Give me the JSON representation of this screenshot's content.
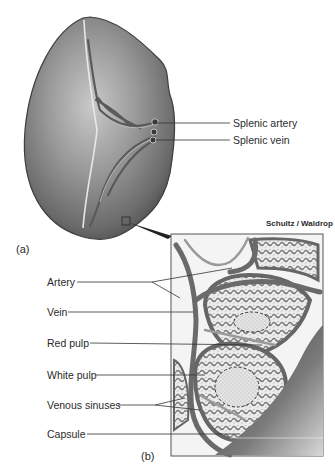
{
  "figure": {
    "part_a_label": "(a)",
    "part_b_label": "(b)",
    "credit": "Schultz / Waldrop",
    "labels_a": [
      {
        "text": "Splenic artery"
      },
      {
        "text": "Splenic vein"
      }
    ],
    "labels_b": [
      {
        "text": "Artery"
      },
      {
        "text": "Vein"
      },
      {
        "text": "Red pulp"
      },
      {
        "text": "White pulp"
      },
      {
        "text": "Venous sinuses"
      },
      {
        "text": "Capsule"
      }
    ],
    "colors": {
      "organ_dark": "#4a4a4a",
      "organ_mid": "#8a8a8a",
      "organ_light": "#c8c8c8",
      "vessel": "#6e6e6e",
      "pulp_fill": "#e6e6e6",
      "leader_line": "#333333"
    }
  }
}
